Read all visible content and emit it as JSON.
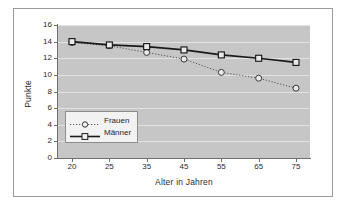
{
  "figure": {
    "background_color": "#ffffff",
    "frame_color": "#9a9a9a",
    "plot_background_color": "#c6c6c6",
    "gridline_color": "#e2e2e2",
    "axis_color": "#6f6f6f"
  },
  "chart_data": {
    "type": "line",
    "title": "",
    "xlabel": "Alter in Jahren",
    "ylabel": "Punkte",
    "x": [
      20,
      25,
      35,
      45,
      55,
      65,
      75
    ],
    "xtick_labels": [
      "20",
      "25",
      "35",
      "45",
      "55",
      "65",
      "75"
    ],
    "ytick_labels": [
      "0",
      "2",
      "4",
      "6",
      "8",
      "10",
      "12",
      "14",
      "16"
    ],
    "yticks": [
      0,
      2,
      4,
      6,
      8,
      10,
      12,
      14,
      16
    ],
    "ylim": [
      0,
      16
    ],
    "grid": "horizontal",
    "legend_position": "inner-lower-left",
    "series": [
      {
        "name": "Frauen",
        "values": [
          13.9,
          13.5,
          12.7,
          11.9,
          10.3,
          9.6,
          8.4
        ],
        "line_style": "dotted",
        "marker": "circle-open",
        "color": "#555555"
      },
      {
        "name": "Männer",
        "values": [
          14.0,
          13.6,
          13.4,
          13.0,
          12.4,
          12.0,
          11.5
        ],
        "line_style": "solid",
        "marker": "square-open",
        "color": "#1a1a1a"
      }
    ]
  },
  "legend": {
    "items": [
      {
        "label": "Frauen"
      },
      {
        "label": "Männer"
      }
    ]
  }
}
